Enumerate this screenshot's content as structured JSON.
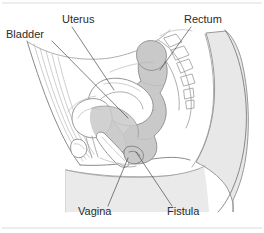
{
  "figure": {
    "width": 264,
    "height": 233,
    "background_color": "#ffffff"
  },
  "labels": [
    {
      "id": "bladder",
      "text": "Bladder",
      "text_x": 6,
      "text_y": 38,
      "leader_path": "M 52 41 L 128 118",
      "anchor": "start"
    },
    {
      "id": "uterus",
      "text": "Uterus",
      "text_x": 62,
      "text_y": 23,
      "leader_path": "M 72 27 L 114 90",
      "anchor": "start"
    },
    {
      "id": "rectum",
      "text": "Rectum",
      "text_x": 184,
      "text_y": 23,
      "leader_path": "M 191 27 L 160 70",
      "anchor": "start"
    },
    {
      "id": "vagina",
      "text": "Vagina",
      "text_x": 78,
      "text_y": 215,
      "leader_path": "M 108 206 L 128 158",
      "anchor": "start"
    },
    {
      "id": "fistula",
      "text": "Fistula",
      "text_x": 167,
      "text_y": 215,
      "leader_path": "M 172 206 L 136 152",
      "anchor": "start"
    }
  ],
  "rules": [
    {
      "id": "top-rule",
      "x1": 2,
      "y1": 3,
      "x2": 262,
      "y2": 3
    },
    {
      "id": "bottom-rule",
      "x1": 2,
      "y1": 228,
      "x2": 262,
      "y2": 228
    }
  ],
  "colors": {
    "body_fill": "#ffffff",
    "buttock_fill": "#e8e8e8",
    "organ_gray": "#c9c9c9",
    "organ_light": "#dddddd",
    "outline": "#9a9a9a",
    "outline_dark": "#7d7d7d",
    "outline_faint": "#b9b9b9",
    "leader": "#4a4a4a",
    "rule": "#dcdcdc",
    "text": "#2b2b2b"
  },
  "anatomy": {
    "structures": [
      "body-outline",
      "abdominal-wall",
      "buttock",
      "sacrum",
      "vertebrae",
      "rectum",
      "uterus",
      "bladder",
      "vagina",
      "pubic-bone",
      "fistula-tract"
    ]
  }
}
